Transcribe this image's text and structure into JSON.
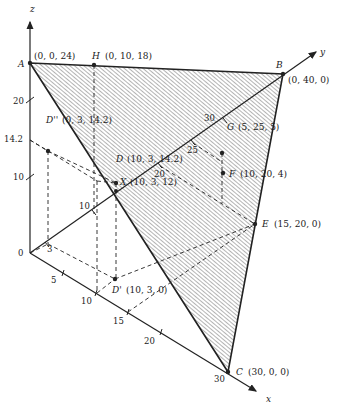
{
  "diagram": {
    "type": "3d-coordinate-plane",
    "axes": {
      "x": {
        "label": "x",
        "ticks": [
          "5",
          "10",
          "15",
          "20",
          "30"
        ]
      },
      "y": {
        "label": "y",
        "ticks": [
          "3",
          "10",
          "20",
          "25",
          "30"
        ]
      },
      "z": {
        "label": "z",
        "ticks": [
          "10",
          "14.2",
          "20"
        ]
      },
      "origin": "0"
    },
    "points": {
      "A": {
        "name": "A",
        "coords": "(0, 0, 24)"
      },
      "H": {
        "name": "H",
        "coords": "(0, 10, 18)"
      },
      "B": {
        "name": "B",
        "coords": "(0, 40, 0)"
      },
      "C": {
        "name": "C",
        "coords": "(30, 0, 0)"
      },
      "D2": {
        "name": "D''",
        "coords": "(0, 3, 14.2)"
      },
      "D": {
        "name": "D",
        "coords": "(10, 3, 14.2)"
      },
      "X": {
        "name": "X",
        "coords": "(10, 3, 12)"
      },
      "D1": {
        "name": "D'",
        "coords": "(10, 3, 0)"
      },
      "G": {
        "name": "G",
        "coords": "(5, 25, 5)"
      },
      "F": {
        "name": "F",
        "coords": "(10, 20, 4)"
      },
      "E": {
        "name": "E",
        "coords": "(15, 20, 0)"
      }
    },
    "colors": {
      "ink": "#222222",
      "hatch": "#444444",
      "background": "#ffffff"
    }
  }
}
